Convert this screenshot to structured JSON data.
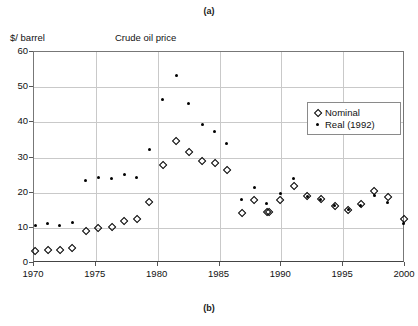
{
  "figure": {
    "caption_top": "(a)",
    "caption_bottom": "(b)"
  },
  "chart_data": {
    "type": "scatter",
    "title": "Crude   oil   price",
    "xlabel": "",
    "ylabel": "$/ barrel",
    "xlim": [
      1970,
      2000
    ],
    "ylim": [
      0,
      60
    ],
    "xticks": [
      1970,
      1975,
      1980,
      1985,
      1990,
      1995,
      2000
    ],
    "yticks": [
      0,
      10,
      20,
      30,
      40,
      50,
      60
    ],
    "grid": true,
    "legend_position": "upper-right-inside",
    "legend": [
      "Nominal",
      "Real (1992)"
    ],
    "series": [
      {
        "name": "Nominal",
        "marker": "open-diamond",
        "color": "#000000",
        "x": [
          1970.1,
          1971.1,
          1972.1,
          1973.1,
          1974.2,
          1975.2,
          1976.3,
          1977.3,
          1978.3,
          1979.3,
          1980.4,
          1981.5,
          1982.5,
          1983.6,
          1984.6,
          1985.6,
          1986.8,
          1987.8,
          1988.8,
          1989.0,
          1989.9,
          1991.0,
          1992.1,
          1993.2,
          1994.3,
          1995.4,
          1996.4,
          1997.5,
          1998.6,
          1999.9
        ],
        "y": [
          3.4,
          3.7,
          3.7,
          4.2,
          9.0,
          10.1,
          10.4,
          11.9,
          12.4,
          17.4,
          27.9,
          34.8,
          31.7,
          28.9,
          28.4,
          26.6,
          14.2,
          17.8,
          14.4,
          14.5,
          17.8,
          22.0,
          19.2,
          18.2,
          16.1,
          15.1,
          16.9,
          20.4,
          18.9,
          12.4
        ]
      },
      {
        "name": "Real (1992)",
        "marker": "filled-dot",
        "color": "#000000",
        "x": [
          1970.1,
          1971.1,
          1972.1,
          1973.1,
          1974.2,
          1975.2,
          1976.3,
          1977.3,
          1978.3,
          1979.3,
          1980.4,
          1981.5,
          1982.5,
          1983.6,
          1984.6,
          1985.6,
          1986.8,
          1987.8,
          1988.8,
          1989.9,
          1991.0,
          1992.1,
          1993.2,
          1994.3,
          1995.4,
          1996.4,
          1997.5,
          1998.6,
          1999.9
        ],
        "y": [
          10.8,
          11.1,
          10.6,
          11.6,
          23.5,
          24.3,
          24.1,
          25.1,
          24.4,
          32.2,
          46.6,
          53.3,
          45.4,
          39.5,
          37.5,
          34.1,
          18.0,
          21.6,
          17.0,
          19.9,
          23.9,
          19.0,
          18.1,
          16.3,
          15.3,
          16.4,
          19.1,
          17.1,
          11.3
        ]
      }
    ]
  }
}
